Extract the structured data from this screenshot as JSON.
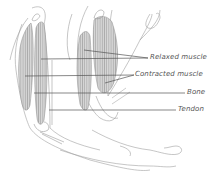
{
  "diagram": {
    "labels": [
      {
        "id": "relaxed",
        "text": "Relaxed muscle",
        "x": 150,
        "y": 55
      },
      {
        "id": "contracted",
        "text": "Contracted muscle",
        "x": 136,
        "y": 72
      },
      {
        "id": "bone",
        "text": "Bone",
        "x": 187,
        "y": 90
      },
      {
        "id": "tendon",
        "text": "Tendon",
        "x": 178,
        "y": 106
      }
    ],
    "colors": {
      "outline": "#9a9a9a",
      "muscle_fill": "#d4d4d4",
      "muscle_stripe": "#8f8f8f",
      "leader_line": "#555555",
      "label_text": "#555555"
    }
  }
}
